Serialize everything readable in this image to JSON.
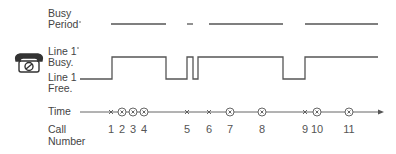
{
  "labels": {
    "busy_period_1": "Busy",
    "busy_period_2": "Period",
    "line_busy_1": "Line 1",
    "line_busy_2": "Busy.",
    "line_free_1": "Line 1",
    "line_free_2": "Free.",
    "time": "Time",
    "call_1": "Call",
    "call_2": "Number"
  },
  "icon": "telephone-icon",
  "colors": {
    "line": "#555555",
    "text": "#444444"
  },
  "busy_periods": [
    [
      111,
      166
    ],
    [
      187,
      193
    ],
    [
      209,
      283
    ],
    [
      305,
      378
    ]
  ],
  "waveform_points": "80,79 112,79 112,57 166,57 166,79 187,79 187,57 193,57 193,79 198,79 198,57 209,57 209,57 283,57 283,79 305,79 305,57 378,57",
  "calls": [
    {
      "n": "1",
      "x": 111,
      "type": "arrival"
    },
    {
      "n": "2",
      "x": 122,
      "type": "blocked"
    },
    {
      "n": "3",
      "x": 133,
      "type": "blocked"
    },
    {
      "n": "4",
      "x": 144,
      "type": "blocked"
    },
    {
      "n": "5",
      "x": 187,
      "type": "arrival"
    },
    {
      "n": "6",
      "x": 209,
      "type": "arrival"
    },
    {
      "n": "7",
      "x": 230,
      "type": "blocked"
    },
    {
      "n": "8",
      "x": 262,
      "type": "blocked"
    },
    {
      "n": "9",
      "x": 305,
      "type": "arrival"
    },
    {
      "n": "10",
      "x": 317,
      "type": "blocked"
    },
    {
      "n": "11",
      "x": 349,
      "type": "blocked"
    }
  ]
}
